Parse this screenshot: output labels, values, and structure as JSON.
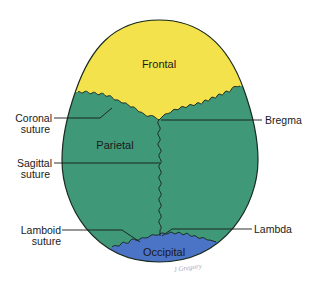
{
  "diagram": {
    "colors": {
      "frontal": "#F3E24C",
      "parietal": "#3F9878",
      "occipital": "#4C74C6",
      "outline": "#1b2b22",
      "leader": "#1a1a1a"
    },
    "bones": {
      "frontal": "Frontal",
      "parietal": "Parietal",
      "occipital": "Occipital"
    },
    "labels": {
      "coronal_line1": "Coronal",
      "coronal_line2": "suture",
      "sagittal_line1": "Sagittal",
      "sagittal_line2": "suture",
      "lamboid_line1": "Lamboid",
      "lamboid_line2": "suture",
      "bregma": "Bregma",
      "lambda": "Lambda"
    },
    "signature": "J Gregory"
  }
}
